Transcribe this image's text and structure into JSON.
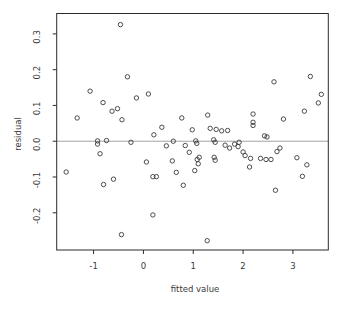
{
  "chart_data": {
    "type": "scatter",
    "title": "",
    "xlabel": "fitted value",
    "ylabel": "residual",
    "xlim": [
      -1.74,
      3.71
    ],
    "ylim": [
      -0.304,
      0.357
    ],
    "x_ticks": [
      -1,
      0,
      1,
      2,
      3
    ],
    "y_ticks": [
      -0.2,
      -0.1,
      0.0,
      0.1,
      0.2,
      0.3
    ],
    "reference_line_y": 0,
    "grid": false,
    "legend": "none",
    "marker": "open-circle",
    "colors": {
      "points": "#3a3a3a",
      "axis": "#2b2b2b",
      "reference_line": "#9a9a9a",
      "background": "#ffffff"
    },
    "points": [
      [
        -0.46,
        0.326
      ],
      [
        -1.33,
        0.065
      ],
      [
        -1.07,
        0.14
      ],
      [
        -0.81,
        0.108
      ],
      [
        -0.63,
        0.084
      ],
      [
        -0.52,
        0.091
      ],
      [
        -0.43,
        0.06
      ],
      [
        -0.32,
        0.18
      ],
      [
        -0.14,
        0.121
      ],
      [
        0.1,
        0.132
      ],
      [
        0.77,
        0.065
      ],
      [
        1.29,
        0.073
      ],
      [
        2.2,
        0.076
      ],
      [
        2.2,
        0.053
      ],
      [
        2.2,
        0.044
      ],
      [
        2.62,
        0.166
      ],
      [
        2.81,
        0.062
      ],
      [
        3.23,
        0.084
      ],
      [
        3.35,
        0.181
      ],
      [
        3.51,
        0.107
      ],
      [
        3.57,
        0.131
      ],
      [
        0.21,
        0.018
      ],
      [
        0.37,
        0.039
      ],
      [
        0.98,
        0.032
      ],
      [
        1.34,
        0.036
      ],
      [
        1.46,
        0.033
      ],
      [
        1.57,
        0.029
      ],
      [
        1.69,
        0.03
      ],
      [
        2.43,
        0.015
      ],
      [
        2.48,
        0.012
      ],
      [
        1.92,
        -0.003
      ],
      [
        1.83,
        -0.008
      ],
      [
        1.9,
        -0.015
      ],
      [
        -0.92,
        0.001
      ],
      [
        -0.92,
        -0.008
      ],
      [
        -0.74,
        0.002
      ],
      [
        -0.25,
        -0.003
      ],
      [
        0.6,
        0.0
      ],
      [
        0.46,
        -0.013
      ],
      [
        0.84,
        -0.012
      ],
      [
        1.05,
        0.001
      ],
      [
        1.07,
        -0.006
      ],
      [
        1.41,
        0.004
      ],
      [
        1.44,
        -0.003
      ],
      [
        1.64,
        -0.011
      ],
      [
        1.73,
        -0.019
      ],
      [
        -0.87,
        -0.035
      ],
      [
        0.06,
        -0.058
      ],
      [
        0.58,
        -0.055
      ],
      [
        0.92,
        -0.031
      ],
      [
        1.08,
        -0.051
      ],
      [
        1.12,
        -0.045
      ],
      [
        1.1,
        -0.063
      ],
      [
        1.42,
        -0.045
      ],
      [
        1.44,
        -0.053
      ],
      [
        0.19,
        -0.099
      ],
      [
        0.26,
        -0.099
      ],
      [
        0.66,
        -0.087
      ],
      [
        0.8,
        -0.123
      ],
      [
        1.03,
        -0.082
      ],
      [
        -1.55,
        -0.086
      ],
      [
        -0.8,
        -0.121
      ],
      [
        -0.6,
        -0.106
      ],
      [
        -0.44,
        -0.261
      ],
      [
        0.19,
        -0.206
      ],
      [
        1.28,
        -0.278
      ],
      [
        2.0,
        -0.03
      ],
      [
        2.04,
        -0.04
      ],
      [
        2.15,
        -0.048
      ],
      [
        2.13,
        -0.072
      ],
      [
        2.35,
        -0.048
      ],
      [
        2.46,
        -0.051
      ],
      [
        2.56,
        -0.051
      ],
      [
        2.68,
        -0.029
      ],
      [
        2.74,
        -0.019
      ],
      [
        2.65,
        -0.137
      ],
      [
        3.08,
        -0.046
      ],
      [
        3.19,
        -0.098
      ],
      [
        3.28,
        -0.066
      ]
    ]
  }
}
